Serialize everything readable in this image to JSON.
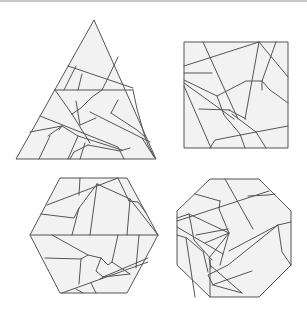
{
  "figure": {
    "colors": {
      "fill": "#f2f2f2",
      "stroke": "#555555",
      "background": "#ffffff",
      "top_border": "#c8c8c8"
    },
    "shapes": [
      {
        "name": "triangle",
        "outline": "94,20 156,159 16,159",
        "cuts": [
          "68,66 133,88",
          "55,90 133,90",
          "76,66 64,90",
          "118,57 107,80 102,90",
          "82,74 78,90",
          "55,90 72,114",
          "72,114 81,108 92,97 102,90",
          "76,101 80,125",
          "80,125 96,118",
          "72,114 90,143",
          "133,90 137,109 145,137",
          "118,100 111,113",
          "111,113 137,130 145,137 148,145 155,158",
          "90,112 150,142",
          "40,116 118,147 124,159",
          "30,132 62,126",
          "48,136 62,126 78,136 122,150",
          "50,136 39,159",
          "78,136 68,159",
          "85,143 80,159",
          "88,145 120,151 130,148",
          "142,138 154,157",
          "62,126 59,130",
          "88,145 74,152 70,159"
        ]
      },
      {
        "name": "square",
        "outline": "184,42 288,42 288,148 184,148",
        "cuts": [
          "184,66 259,42",
          "203,42 238,119",
          "259,42 288,77",
          "259,42 245,119",
          "276,42 262,81 262,90",
          "184,73 212,73",
          "184,80 217,96 246,81 262,81",
          "184,83 234,119",
          "217,96 224,115 240,134 245,148",
          "199,109 230,110",
          "262,81 270,90 288,103",
          "232,114 256,132 266,148",
          "256,132 288,126",
          "210,148 215,140 256,132",
          "184,86 211,148",
          "229,110 246,119"
        ]
      },
      {
        "name": "hexagon",
        "outline": "60,178 127,178 158,235 127,293 60,293 30,235",
        "cuts": [
          "30,235 158,235",
          "47,205 118,178",
          "80,178 79,195",
          "97,184 130,199 158,235",
          "97,184 90,235",
          "97,184 79,208 72,235",
          "41,214 74,218 79,208",
          "118,178 129,201 130,199",
          "129,201 138,202 146,213",
          "130,200 127,235",
          "52,235 88,255 101,258",
          "45,258 81,259 88,255",
          "81,259 79,284",
          "101,258 108,265 112,262 118,235",
          "101,258 96,271 103,277 148,258",
          "112,262 130,274",
          "139,235 136,268",
          "62,293 148,262",
          "76,289 83,293",
          "100,279 103,277 130,274",
          "91,283 96,293"
        ]
      },
      {
        "name": "octagon",
        "outline": "210,179 259,179 291,211 291,265 259,297 210,297 177,265 177,211",
        "cuts": [
          "195,194 220,201",
          "177,221 269,191",
          "225,179 253,229",
          "248,196 268,195 275,194",
          "220,201 219,209 229,233",
          "177,227 223,254",
          "177,218 189,214 229,233",
          "189,214 194,240 212,260",
          "196,235 228,229",
          "205,243 229,233 223,254 220,265",
          "229,233 209,258 211,268",
          "177,235 187,238 202,251",
          "229,251 278,225 291,222",
          "278,225 282,252 291,265",
          "210,265 242,293",
          "242,293 213,285 208,275 228,265 278,225",
          "210,297 210,260",
          "212,285 252,271",
          "186,238 195,297",
          "203,251 208,272"
        ]
      }
    ]
  }
}
